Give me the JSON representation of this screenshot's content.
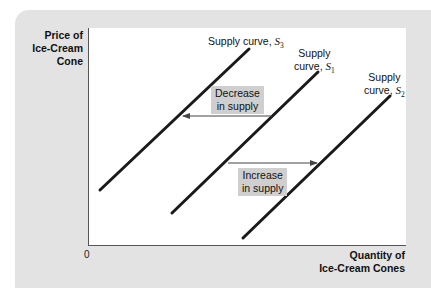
{
  "chart_data": {
    "type": "line",
    "title": "",
    "xlabel": "Quantity of Ice-Cream Cones",
    "ylabel": "Price of Ice-Cream Cone",
    "origin_label": "0",
    "grid": false,
    "legend": "none (direct labels on curves)",
    "series": [
      {
        "name": "Supply curve, S3",
        "label_main": "Supply curve,",
        "symbol": "S",
        "subscript": "3",
        "shape": "upward-sloping straight line",
        "position": "leftmost",
        "pixel_line": {
          "x1": 100,
          "y1": 190,
          "x2": 249,
          "y2": 49
        }
      },
      {
        "name": "Supply curve, S1",
        "label_main_1": "Supply",
        "label_main_2": "curve,",
        "symbol": "S",
        "subscript": "1",
        "shape": "upward-sloping straight line",
        "position": "middle (initial)",
        "pixel_line": {
          "x1": 172,
          "y1": 213,
          "x2": 318,
          "y2": 72
        }
      },
      {
        "name": "Supply curve, S2",
        "label_main_1": "Supply",
        "label_main_2": "curve,",
        "symbol": "S",
        "subscript": "2",
        "shape": "upward-sloping straight line",
        "position": "rightmost",
        "pixel_line": {
          "x1": 243,
          "y1": 238,
          "x2": 390,
          "y2": 96
        }
      }
    ],
    "annotations": [
      {
        "text_line1": "Decrease",
        "text_line2": "in supply",
        "arrow": "leftward from S1 to S3",
        "arrow_pixels": {
          "x1": 272,
          "x2": 183,
          "y": 116
        }
      },
      {
        "text_line1": "Increase",
        "text_line2": "in supply",
        "arrow": "rightward from S1 to S2",
        "arrow_pixels": {
          "x1": 228,
          "x2": 317,
          "y": 163
        }
      }
    ],
    "colors": {
      "line": "#1a1a1a",
      "panel_bg": "#e3e3e3",
      "plot_bg": "#ffffff",
      "annotation_box": "#cfcfcf",
      "arrow": "#444444"
    }
  },
  "axes": {
    "y_label_line1": "Price of",
    "y_label_line2": "Ice-Cream",
    "y_label_line3": "Cone",
    "x_label_line1": "Quantity of",
    "x_label_line2": "Ice-Cream Cones",
    "origin": "0"
  }
}
